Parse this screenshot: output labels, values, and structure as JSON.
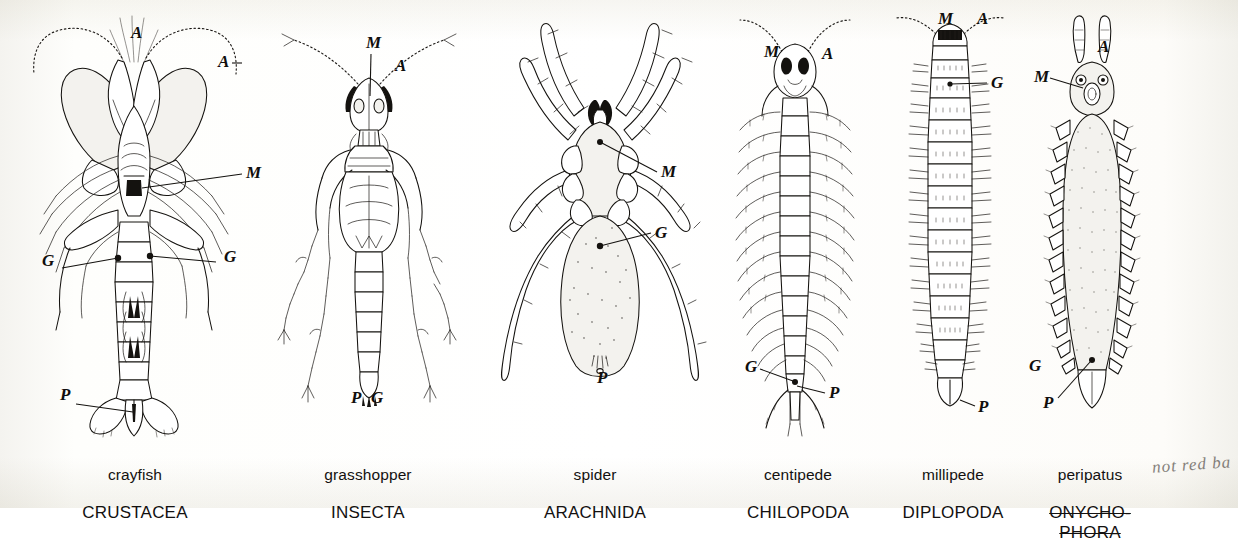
{
  "figure": {
    "kind": "comparative anatomy plate",
    "view": "ventral",
    "background_color": "#ffffff",
    "ink_color": "#14120f",
    "label_key": {
      "A": "antennae",
      "M": "mouthparts",
      "G": "genital opening",
      "P": "posterior / anus"
    }
  },
  "panels": [
    {
      "id": "crayfish",
      "common_name": "crayfish",
      "taxon": "CRUSTACEA",
      "caption_struck": false,
      "marks": [
        {
          "letter": "A",
          "x": 131,
          "y": 38
        },
        {
          "letter": "A",
          "x": 218,
          "y": 67
        },
        {
          "letter": "M",
          "x": 246,
          "y": 178
        },
        {
          "letter": "G",
          "x": 42,
          "y": 266
        },
        {
          "letter": "G",
          "x": 224,
          "y": 262
        },
        {
          "letter": "P",
          "x": 60,
          "y": 400
        }
      ]
    },
    {
      "id": "grasshopper",
      "common_name": "grasshopper",
      "taxon": "INSECTA",
      "caption_struck": false,
      "marks": [
        {
          "letter": "M",
          "x": 366,
          "y": 48
        },
        {
          "letter": "A",
          "x": 395,
          "y": 71
        },
        {
          "letter": "P",
          "x": 351,
          "y": 403
        },
        {
          "letter": "G",
          "x": 371,
          "y": 403
        }
      ]
    },
    {
      "id": "spider",
      "common_name": "spider",
      "taxon": "ARACHNIDA",
      "caption_struck": false,
      "marks": [
        {
          "letter": "M",
          "x": 661,
          "y": 177
        },
        {
          "letter": "G",
          "x": 655,
          "y": 238
        },
        {
          "letter": "P",
          "x": 597,
          "y": 383
        }
      ]
    },
    {
      "id": "centipede",
      "common_name": "centipede",
      "taxon": "CHILOPODA",
      "caption_struck": false,
      "marks": [
        {
          "letter": "M",
          "x": 764,
          "y": 57
        },
        {
          "letter": "A",
          "x": 822,
          "y": 59
        },
        {
          "letter": "G",
          "x": 745,
          "y": 372
        },
        {
          "letter": "P",
          "x": 829,
          "y": 398
        }
      ]
    },
    {
      "id": "millipede",
      "common_name": "millipede",
      "taxon": "DIPLOPODA",
      "caption_struck": false,
      "marks": [
        {
          "letter": "M",
          "x": 938,
          "y": 24
        },
        {
          "letter": "A",
          "x": 977,
          "y": 24
        },
        {
          "letter": "G",
          "x": 991,
          "y": 88
        },
        {
          "letter": "P",
          "x": 978,
          "y": 412
        }
      ]
    },
    {
      "id": "peripatus",
      "common_name": "peripatus",
      "taxon": "ONYCHO-\nPHORA",
      "caption_struck": true,
      "marks": [
        {
          "letter": "A",
          "x": 1098,
          "y": 52
        },
        {
          "letter": "M",
          "x": 1034,
          "y": 82
        },
        {
          "letter": "G",
          "x": 1029,
          "y": 371
        },
        {
          "letter": "P",
          "x": 1043,
          "y": 408
        }
      ]
    }
  ],
  "annotation": {
    "handwritten_note": "not red ba",
    "color": "#6f6b66"
  }
}
